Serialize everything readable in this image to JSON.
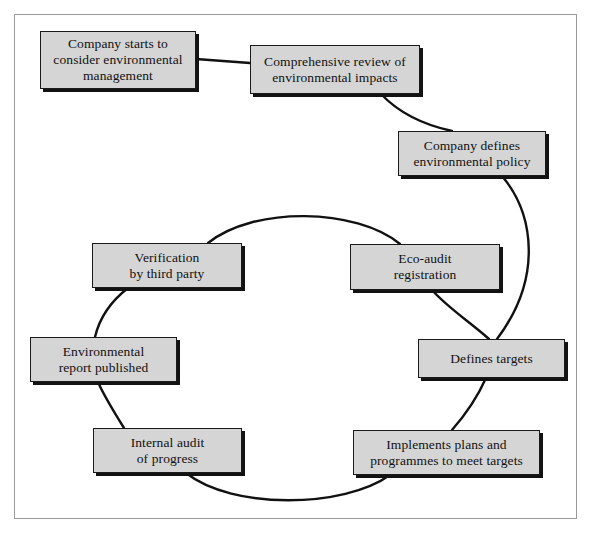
{
  "figure": {
    "width": 590,
    "height": 535,
    "colors": {
      "box_fill": "#d5d5d5",
      "box_border": "#1a1a1a",
      "box_shadow": "#121212",
      "connector": "#111111",
      "frame_border": "#9a9a9a",
      "background": "#ffffff",
      "text": "#111111"
    }
  },
  "nodes": [
    {
      "id": "company-starts",
      "label": "Company starts to consider environmental management",
      "lines": [
        "Company starts to",
        "consider environmental",
        "management"
      ],
      "x": 40,
      "y": 31,
      "w": 156,
      "h": 58
    },
    {
      "id": "comprehensive-review",
      "label": "Comprehensive review of environmental impacts",
      "lines": [
        "Comprehensive review of",
        "environmental impacts"
      ],
      "x": 250,
      "y": 45,
      "w": 170,
      "h": 49
    },
    {
      "id": "company-defines-policy",
      "label": "Company defines environmental policy",
      "lines": [
        "Company defines",
        "environmental policy"
      ],
      "x": 398,
      "y": 131,
      "w": 148,
      "h": 45
    },
    {
      "id": "eco-audit-registration",
      "label": "Eco-audit registration",
      "lines": [
        "Eco-audit",
        "registration"
      ],
      "x": 350,
      "y": 244,
      "w": 150,
      "h": 46
    },
    {
      "id": "verification-third-party",
      "label": "Verification by third party",
      "lines": [
        "Verification",
        "by third party"
      ],
      "x": 92,
      "y": 243,
      "w": 150,
      "h": 45
    },
    {
      "id": "defines-targets",
      "label": "Defines targets",
      "lines": [
        "Defines targets"
      ],
      "x": 418,
      "y": 339,
      "w": 147,
      "h": 39
    },
    {
      "id": "environmental-report-published",
      "label": "Environmental report published",
      "lines": [
        "Environmental",
        "report published"
      ],
      "x": 30,
      "y": 337,
      "w": 147,
      "h": 45
    },
    {
      "id": "implements-plans",
      "label": "Implements plans and programmes to meet targets",
      "lines": [
        "Implements plans and",
        "programmes to meet targets"
      ],
      "x": 353,
      "y": 430,
      "w": 187,
      "h": 45
    },
    {
      "id": "internal-audit",
      "label": "Internal audit of progress",
      "lines": [
        "Internal audit",
        "of progress"
      ],
      "x": 93,
      "y": 428,
      "w": 149,
      "h": 45
    }
  ],
  "connectors": [
    {
      "id": "starts-to-review",
      "from": "company-starts",
      "to": "comprehensive-review"
    },
    {
      "id": "review-to-policy",
      "from": "comprehensive-review",
      "to": "company-defines-policy"
    },
    {
      "id": "policy-to-targets",
      "from": "company-defines-policy",
      "to": "defines-targets"
    },
    {
      "id": "ecoaudit-to-targets",
      "from": "eco-audit-registration",
      "to": "defines-targets"
    },
    {
      "id": "targets-to-implements",
      "from": "defines-targets",
      "to": "implements-plans"
    },
    {
      "id": "implements-to-internal-audit",
      "from": "implements-plans",
      "to": "internal-audit"
    },
    {
      "id": "internal-audit-to-report",
      "from": "internal-audit",
      "to": "environmental-report-published"
    },
    {
      "id": "report-to-verification",
      "from": "environmental-report-published",
      "to": "verification-third-party"
    },
    {
      "id": "verification-to-ecoaudit",
      "from": "verification-third-party",
      "to": "eco-audit-registration"
    }
  ]
}
